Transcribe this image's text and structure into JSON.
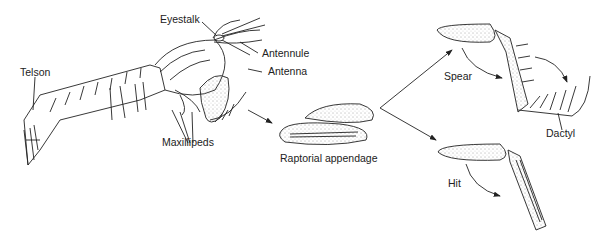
{
  "figure": {
    "labels": {
      "eyestalk": "Eyestalk",
      "antennule": "Antennule",
      "antenna": "Antenna",
      "telson": "Telson",
      "maxillipeds": "Maxillipeds",
      "raptorial": "Raptorial appendage",
      "spear": "Spear",
      "dactyl": "Dactyl",
      "hit": "Hit"
    },
    "colors": {
      "ink": "#222222",
      "background": "#ffffff"
    }
  }
}
